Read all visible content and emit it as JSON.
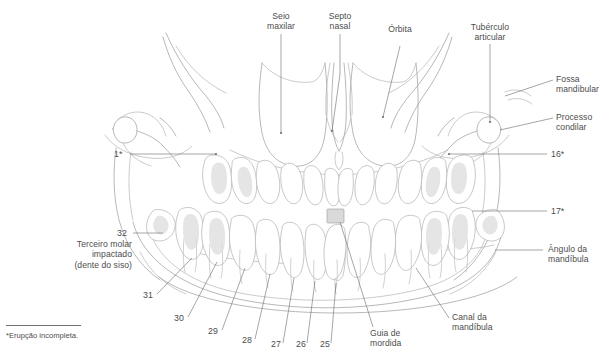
{
  "figure": {
    "background_color": "#ffffff",
    "line_color": "#9a9a9a",
    "leader_color": "#6e6e6e",
    "text_color": "#4d4d4d"
  },
  "labels": {
    "seio_maxilar": {
      "text": "Seio\nmaxilar",
      "x": 251,
      "y": 11,
      "w": 60,
      "align": "c"
    },
    "septo_nasal": {
      "text": "Septo\nnasal",
      "x": 322,
      "y": 11,
      "w": 50,
      "align": "c"
    },
    "orbita": {
      "text": "Órbita",
      "x": 382,
      "y": 24,
      "w": 46,
      "align": "c"
    },
    "tuberculo": {
      "text": "Tubérculo\narticular",
      "x": 460,
      "y": 22,
      "w": 64,
      "align": "c"
    },
    "fossa_mandibular": {
      "text": "Fossa\nmandibular",
      "x": 556,
      "y": 75,
      "w": 58,
      "align": "l"
    },
    "processo_condilar": {
      "text": "Processo\ncondilar",
      "x": 556,
      "y": 112,
      "w": 58,
      "align": "l"
    },
    "angulo_mandibula": {
      "text": "Ângulo da\nmandíbula",
      "x": 546,
      "y": 246,
      "w": 66,
      "align": "l"
    },
    "canal_mandibula": {
      "text": "Canal da\nmandíbula",
      "x": 452,
      "y": 313,
      "w": 58,
      "align": "l"
    },
    "guia_mordida": {
      "text": "Guia de\nmordida",
      "x": 370,
      "y": 330,
      "w": 48,
      "align": "l"
    },
    "terceiro_molar": {
      "text": "Terceiro molar\nimpactado\n(dente do siso)",
      "x": 60,
      "y": 240,
      "w": 90,
      "align": "r"
    }
  },
  "tooth_numbers": {
    "n1": {
      "text": "1*",
      "x": 114,
      "y": 150
    },
    "n16": {
      "text": "16*",
      "x": 551,
      "y": 150
    },
    "n17": {
      "text": "17*",
      "x": 551,
      "y": 207
    },
    "n32": {
      "text": "32",
      "x": 117,
      "y": 230
    },
    "n31": {
      "text": "31",
      "x": 144,
      "y": 297
    },
    "n30": {
      "text": "30",
      "x": 175,
      "y": 320
    },
    "n29": {
      "text": "29",
      "x": 209,
      "y": 333
    },
    "n28": {
      "text": "28",
      "x": 243,
      "y": 342
    },
    "n27": {
      "text": "27",
      "x": 272,
      "y": 346
    },
    "n26": {
      "text": "26",
      "x": 297,
      "y": 346
    },
    "n25": {
      "text": "25",
      "x": 321,
      "y": 346
    }
  },
  "footnote": {
    "text": "*Erupção incompleta.",
    "rule_x": 6,
    "rule_y": 325,
    "rule_w": 75,
    "x": 6,
    "y": 332
  }
}
